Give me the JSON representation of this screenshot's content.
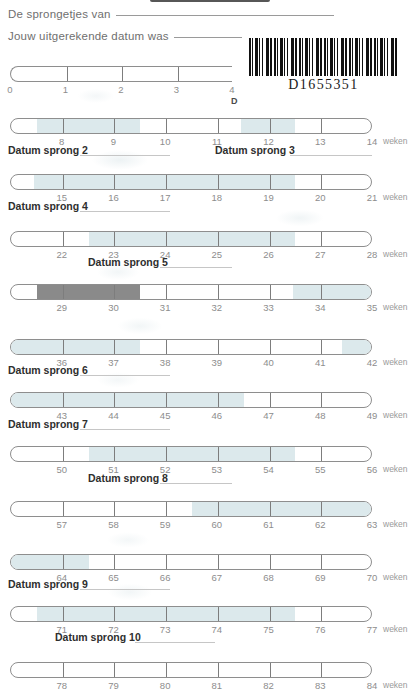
{
  "document": {
    "language": "nl",
    "barcode_value": "D1655351"
  },
  "header": {
    "line1_label": "De sprongetjes van",
    "line2_label": "Jouw uitgerekende datum was",
    "fragment_below_first_bar": "D"
  },
  "axis_unit_label": "weken",
  "chart_data": {
    "type": "bar",
    "title": "De sprongetjes van",
    "xlabel": "weken",
    "ylabel": "",
    "grid": false,
    "legend": "none",
    "rows": [
      {
        "id": "row-1",
        "ticks": [
          "0",
          "1",
          "2",
          "3",
          "4"
        ],
        "start_week": 0,
        "end_week": 4,
        "clipped_right": true,
        "fills": [],
        "sprong_label": "",
        "weken": ""
      },
      {
        "id": "row-2",
        "ticks": [
          "8",
          "9",
          "10",
          "11",
          "12",
          "13",
          "14"
        ],
        "start_week": 7,
        "end_week": 14,
        "fills": [
          {
            "from": 7.5,
            "to": 9.5,
            "shade": "light"
          },
          {
            "from": 11.45,
            "to": 12.5,
            "shade": "light"
          }
        ],
        "sprong_label": "Datum sprong 2",
        "sprong_label_2": "Datum sprong 3",
        "weken": "weken"
      },
      {
        "id": "row-3",
        "ticks": [
          "15",
          "16",
          "17",
          "18",
          "19",
          "20",
          "21"
        ],
        "start_week": 14,
        "end_week": 21,
        "fills": [
          {
            "from": 14.45,
            "to": 19.5,
            "shade": "light"
          }
        ],
        "sprong_label": "Datum sprong 4",
        "weken": "weken"
      },
      {
        "id": "row-4",
        "ticks": [
          "22",
          "23",
          "24",
          "25",
          "26",
          "27",
          "28"
        ],
        "start_week": 21,
        "end_week": 28,
        "fills": [
          {
            "from": 22.5,
            "to": 26.5,
            "shade": "light"
          }
        ],
        "sprong_label": "Datum sprong 5",
        "weken": "weken"
      },
      {
        "id": "row-5",
        "ticks": [
          "29",
          "30",
          "31",
          "32",
          "33",
          "34",
          "35"
        ],
        "start_week": 28,
        "end_week": 35,
        "fills": [
          {
            "from": 28.5,
            "to": 30.5,
            "shade": "dark"
          },
          {
            "from": 33.45,
            "to": 35.0,
            "shade": "light"
          }
        ],
        "sprong_label": "",
        "weken": "weken"
      },
      {
        "id": "row-6",
        "ticks": [
          "36",
          "37",
          "38",
          "39",
          "40",
          "41",
          "42"
        ],
        "start_week": 35,
        "end_week": 42,
        "fills": [
          {
            "from": 35.0,
            "to": 37.5,
            "shade": "light"
          },
          {
            "from": 41.4,
            "to": 42.0,
            "shade": "light"
          }
        ],
        "sprong_label": "Datum sprong 6",
        "weken": "weken"
      },
      {
        "id": "row-7",
        "ticks": [
          "43",
          "44",
          "45",
          "46",
          "47",
          "48",
          "49"
        ],
        "start_week": 42,
        "end_week": 49,
        "fills": [
          {
            "from": 42.0,
            "to": 46.5,
            "shade": "light"
          }
        ],
        "sprong_label": "Datum sprong 7",
        "weken": "weken"
      },
      {
        "id": "row-8",
        "ticks": [
          "50",
          "51",
          "52",
          "53",
          "54",
          "55",
          "56"
        ],
        "start_week": 49,
        "end_week": 56,
        "fills": [
          {
            "from": 50.5,
            "to": 54.5,
            "shade": "light"
          }
        ],
        "sprong_label": "Datum sprong 8",
        "weken": "weken"
      },
      {
        "id": "row-9",
        "ticks": [
          "57",
          "58",
          "59",
          "60",
          "61",
          "62",
          "63"
        ],
        "start_week": 56,
        "end_week": 63,
        "fills": [
          {
            "from": 59.5,
            "to": 63.0,
            "shade": "light"
          }
        ],
        "sprong_label": "",
        "weken": "weken"
      },
      {
        "id": "row-10",
        "ticks": [
          "64",
          "65",
          "66",
          "67",
          "68",
          "69",
          "70"
        ],
        "start_week": 63,
        "end_week": 70,
        "fills": [
          {
            "from": 63.0,
            "to": 64.5,
            "shade": "light"
          }
        ],
        "sprong_label": "Datum sprong 9",
        "weken": "weken"
      },
      {
        "id": "row-11",
        "ticks": [
          "71",
          "72",
          "73",
          "74",
          "75",
          "76",
          "77"
        ],
        "start_week": 70,
        "end_week": 77,
        "fills": [
          {
            "from": 70.5,
            "to": 75.5,
            "shade": "light"
          }
        ],
        "sprong_label": "Datum sprong 10",
        "weken": "weken"
      },
      {
        "id": "row-12",
        "ticks": [
          "78",
          "79",
          "80",
          "81",
          "82",
          "83",
          "84"
        ],
        "start_week": 77,
        "end_week": 84,
        "fills": [],
        "sprong_label": "",
        "weken": "weken"
      }
    ]
  },
  "colors": {
    "fill_light": "#dce9ec",
    "fill_dark": "#8a8a8a",
    "bar_outline": "#8e8e8e",
    "tick_label": "#8d8d8d",
    "heading_text": "#6f6f6f",
    "sprong_text": "#2e2e2e"
  }
}
